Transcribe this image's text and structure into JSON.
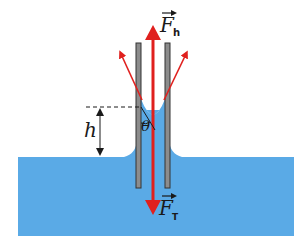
{
  "diagram": {
    "colors": {
      "water": "#5aaae6",
      "tube_fill": "#8c8c8c",
      "tube_stroke": "#333333",
      "force_arrow": "#e0201e",
      "text": "#1a1a1a",
      "dashed_line": "#1a1a1a"
    },
    "labels": {
      "force_up": {
        "symbol": "F",
        "subscript": "h",
        "arrow": "vector-arrow"
      },
      "force_down": {
        "symbol": "F",
        "subscript": "T",
        "arrow": "vector-arrow"
      },
      "height": "h",
      "angle": "θ"
    },
    "elements": [
      {
        "name": "water-basin",
        "description": "liquid reservoir"
      },
      {
        "name": "capillary-wall-left",
        "description": "left tube wall"
      },
      {
        "name": "capillary-wall-right",
        "description": "right tube wall"
      },
      {
        "name": "meniscus",
        "description": "concave liquid surface in tube"
      },
      {
        "name": "surface-tension-arrows",
        "description": "angled arrows at contact line"
      },
      {
        "name": "height-dimension",
        "description": "capillary rise h"
      },
      {
        "name": "contact-angle",
        "description": "contact angle θ"
      }
    ]
  }
}
